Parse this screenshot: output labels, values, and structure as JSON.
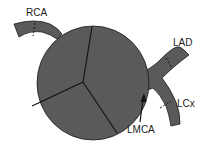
{
  "diagram": {
    "labels": {
      "rca": "RCA",
      "lad": "LAD",
      "lcx": "LCx",
      "lmca": "LMCA"
    },
    "colors": {
      "fill": "#5a5a5a",
      "stroke": "#1a1a1a",
      "text": "#222222",
      "background": "#ffffff"
    },
    "heart_segments": 3
  }
}
